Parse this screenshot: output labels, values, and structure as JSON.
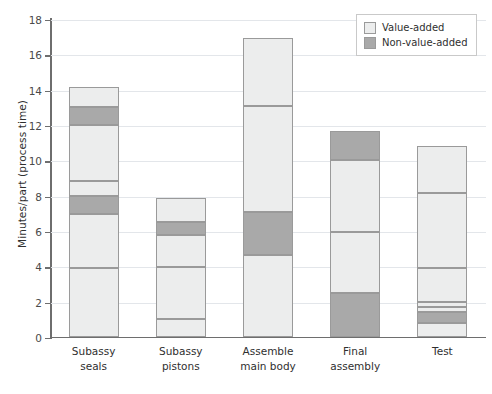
{
  "chart_data": {
    "type": "bar",
    "title": "",
    "subtitle": "",
    "xlabel": "",
    "ylabel": "Minutes/part (process time)",
    "ylim": [
      0,
      18
    ],
    "yticks": [
      0,
      2,
      4,
      6,
      8,
      10,
      12,
      14,
      16,
      18
    ],
    "ytick_labels": [
      "0",
      "2",
      "4",
      "6",
      "8",
      "10",
      "12",
      "14",
      "16",
      "18"
    ],
    "grid": true,
    "stacked": true,
    "legend_position": "top-right",
    "legend": [
      {
        "label": "Value-added",
        "key": "va",
        "color": "#eceded"
      },
      {
        "label": "Non-value-added",
        "key": "nva",
        "color": "#a9a9a9"
      }
    ],
    "categories": [
      "Subassy seals",
      "Subassy pistons",
      "Assemble main body",
      "Final assembly",
      "Test"
    ],
    "category_lines": [
      [
        "Subassy",
        "seals"
      ],
      [
        "Subassy",
        "pistons"
      ],
      [
        "Assemble",
        "main body"
      ],
      [
        "Final",
        "assembly"
      ],
      [
        "Test"
      ]
    ],
    "totals": [
      14.15,
      7.85,
      16.9,
      11.65,
      10.8
    ],
    "series": [
      {
        "name": "Value-added",
        "values": [
          12.1,
          7.1,
          14.45,
          7.5,
          10.2
        ]
      },
      {
        "name": "Non-value-added",
        "values": [
          2.05,
          0.75,
          2.45,
          4.15,
          0.6
        ]
      }
    ],
    "bars": [
      {
        "category": "Subassy seals",
        "total": 14.15,
        "segments": [
          {
            "type": "va",
            "start": 0,
            "end": 3.9
          },
          {
            "type": "va",
            "start": 3.9,
            "end": 6.95
          },
          {
            "type": "nva",
            "start": 6.95,
            "end": 8.0
          },
          {
            "type": "va",
            "start": 8.0,
            "end": 8.85
          },
          {
            "type": "va",
            "start": 8.85,
            "end": 12.0
          },
          {
            "type": "nva",
            "start": 12.0,
            "end": 13.0
          },
          {
            "type": "va",
            "start": 13.0,
            "end": 14.15
          }
        ]
      },
      {
        "category": "Subassy pistons",
        "total": 7.85,
        "segments": [
          {
            "type": "va",
            "start": 0,
            "end": 1.0
          },
          {
            "type": "va",
            "start": 1.0,
            "end": 3.95
          },
          {
            "type": "va",
            "start": 3.95,
            "end": 5.75
          },
          {
            "type": "nva",
            "start": 5.75,
            "end": 6.5
          },
          {
            "type": "va",
            "start": 6.5,
            "end": 7.85
          }
        ]
      },
      {
        "category": "Assemble main body",
        "total": 16.9,
        "segments": [
          {
            "type": "va",
            "start": 0,
            "end": 4.65
          },
          {
            "type": "nva",
            "start": 4.65,
            "end": 7.1
          },
          {
            "type": "va",
            "start": 7.1,
            "end": 13.05
          },
          {
            "type": "va",
            "start": 13.05,
            "end": 16.9
          }
        ]
      },
      {
        "category": "Final assembly",
        "total": 11.65,
        "segments": [
          {
            "type": "nva",
            "start": 0,
            "end": 2.5
          },
          {
            "type": "va",
            "start": 2.5,
            "end": 5.95
          },
          {
            "type": "va",
            "start": 5.95,
            "end": 10.0
          },
          {
            "type": "nva",
            "start": 10.0,
            "end": 11.65
          }
        ]
      },
      {
        "category": "Test",
        "total": 10.8,
        "segments": [
          {
            "type": "va",
            "start": 0,
            "end": 0.8
          },
          {
            "type": "nva",
            "start": 0.8,
            "end": 1.4
          },
          {
            "type": "va",
            "start": 1.4,
            "end": 1.72
          },
          {
            "type": "va",
            "start": 1.72,
            "end": 1.98
          },
          {
            "type": "va",
            "start": 1.98,
            "end": 3.9
          },
          {
            "type": "va",
            "start": 3.9,
            "end": 8.15
          },
          {
            "type": "va",
            "start": 8.15,
            "end": 10.8
          }
        ]
      }
    ]
  }
}
